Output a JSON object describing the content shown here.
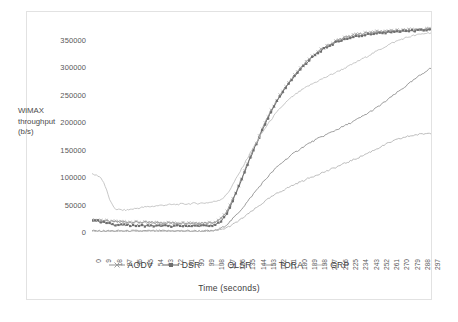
{
  "figure": {
    "top_sliver_text": "",
    "background": "#ffffff",
    "border_color": "#e2e2e2"
  },
  "chart_data": {
    "type": "line",
    "title": "",
    "xlabel": "Time (seconds)",
    "ylabel": "WiMAX throughput (b/s)",
    "ylabel_lines": [
      "WiMAX",
      "throughput",
      "(b/s)"
    ],
    "grid": false,
    "legend_position": "bottom",
    "xlim": [
      0,
      297
    ],
    "ylim": [
      0,
      375000
    ],
    "ytick_labels": [
      "0",
      "50000",
      "100000",
      "150000",
      "200000",
      "250000",
      "300000",
      "350000"
    ],
    "ytick_values": [
      0,
      50000,
      100000,
      150000,
      200000,
      250000,
      300000,
      350000
    ],
    "xtick_labels": [
      "0",
      "9",
      "18",
      "27",
      "36",
      "45",
      "54",
      "63",
      "72",
      "81",
      "90",
      "99",
      "108",
      "117",
      "126",
      "135",
      "144",
      "153",
      "162",
      "171",
      "180",
      "189",
      "198",
      "207",
      "216",
      "225",
      "234",
      "243",
      "252",
      "261",
      "270",
      "279",
      "288",
      "297"
    ],
    "x": [
      0,
      9,
      18,
      27,
      36,
      45,
      54,
      63,
      72,
      81,
      90,
      99,
      108,
      117,
      126,
      135,
      144,
      153,
      162,
      171,
      180,
      189,
      198,
      207,
      216,
      225,
      234,
      243,
      252,
      261,
      270,
      279,
      288,
      297
    ],
    "series": [
      {
        "name": "AODV",
        "color": "#9d9d9d",
        "marker": "x",
        "values": [
          23000,
          21000,
          19000,
          18500,
          18000,
          17500,
          17000,
          17000,
          16500,
          16500,
          16500,
          17000,
          19000,
          34000,
          72000,
          118000,
          163000,
          205000,
          240000,
          268000,
          292000,
          312000,
          328000,
          340000,
          350000,
          356000,
          360000,
          363000,
          365000,
          366000,
          367000,
          368000,
          369000,
          370000
        ]
      },
      {
        "name": "DSR",
        "color": "#6e6e6e",
        "marker": "square",
        "values": [
          22000,
          18000,
          14000,
          12500,
          12000,
          11500,
          11000,
          11000,
          11000,
          11000,
          11000,
          11500,
          13000,
          30000,
          70000,
          116000,
          160000,
          202000,
          238000,
          266000,
          290000,
          310000,
          326000,
          338000,
          347000,
          353000,
          357000,
          360000,
          362000,
          364000,
          365000,
          366000,
          367000,
          368000
        ]
      },
      {
        "name": "OLSR",
        "color": "#bdbdbd",
        "marker": "none",
        "values": [
          105000,
          95000,
          48000,
          40000,
          42000,
          45000,
          47000,
          49000,
          50000,
          51000,
          52000,
          53000,
          56000,
          66000,
          96000,
          130000,
          163000,
          193000,
          218000,
          238000,
          253000,
          265000,
          275000,
          284000,
          293000,
          302000,
          312000,
          322000,
          332000,
          342000,
          350000,
          356000,
          360000,
          363000
        ]
      },
      {
        "name": "TORA",
        "color": "#8a8a8a",
        "marker": "none",
        "values": [
          2000,
          2000,
          2000,
          2000,
          2000,
          2000,
          2000,
          2000,
          2000,
          2000,
          2000,
          2000,
          3000,
          12000,
          30000,
          52000,
          76000,
          98000,
          118000,
          134000,
          148000,
          160000,
          170000,
          179000,
          188000,
          197000,
          207000,
          218000,
          230000,
          244000,
          258000,
          272000,
          286000,
          298000
        ]
      },
      {
        "name": "GRP",
        "color": "#b0b0b0",
        "marker": "none",
        "values": [
          1000,
          1000,
          1000,
          1000,
          1000,
          1000,
          1000,
          1000,
          1000,
          1000,
          1000,
          1000,
          2000,
          7000,
          17000,
          30000,
          44000,
          58000,
          70000,
          80000,
          89000,
          97000,
          105000,
          112000,
          120000,
          128000,
          136000,
          145000,
          154000,
          163000,
          170000,
          175000,
          178000,
          180000
        ]
      }
    ]
  },
  "legend": {
    "items": [
      {
        "label": "AODV"
      },
      {
        "label": "DSR"
      },
      {
        "label": "OLSR"
      },
      {
        "label": "TORA"
      },
      {
        "label": "GRP"
      }
    ]
  }
}
